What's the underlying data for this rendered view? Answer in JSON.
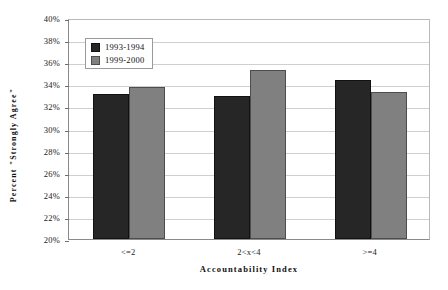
{
  "chart_data": {
    "type": "bar",
    "title": "",
    "xlabel": "Accountability Index",
    "ylabel": "Percent \"Strongly Agree\"",
    "categories": [
      "<=2",
      "2<x<4",
      ">=4"
    ],
    "series": [
      {
        "name": "1993-1994",
        "color": "#262626",
        "values": [
          33.1,
          32.9,
          34.4
        ]
      },
      {
        "name": "1999-2000",
        "color": "#808080",
        "values": [
          33.8,
          35.3,
          33.3
        ]
      }
    ],
    "ylim": [
      20,
      40
    ],
    "ytick_step": 2,
    "ytick_labels": [
      "40%",
      "38%",
      "36%",
      "34%",
      "32%",
      "30%",
      "28%",
      "26%",
      "24%",
      "22%",
      "20%"
    ],
    "ytick_values": [
      40,
      38,
      36,
      34,
      32,
      30,
      28,
      26,
      24,
      22,
      20
    ],
    "grid": true,
    "legend_position": "top-left-inside",
    "value_format": "percent"
  }
}
